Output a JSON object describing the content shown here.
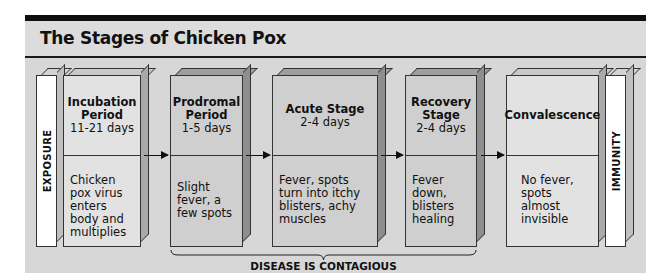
{
  "title": "The Stages of Chicken Pox",
  "start_marker": "EXPOSURE",
  "end_marker": "IMMUNITY",
  "stages": [
    {
      "name": "Incubation Period",
      "name_lines": [
        "Incubation",
        "Period"
      ],
      "duration": "11-21 days",
      "description": "Chicken pox virus enters body and multiplies"
    },
    {
      "name": "Prodromal Period",
      "name_lines": [
        "Prodromal",
        "Period"
      ],
      "duration": "1-5 days",
      "description": "Slight fever, a few spots"
    },
    {
      "name": "Acute Stage",
      "name_lines": [
        "Acute Stage"
      ],
      "duration": "2-4 days",
      "description": "Fever, spots turn into itchy blisters, achy muscles"
    },
    {
      "name": "Recovery Stage",
      "name_lines": [
        "Recovery",
        "Stage"
      ],
      "duration": "2-4 days",
      "description": "Fever down, blisters healing"
    },
    {
      "name": "Convalescence",
      "name_lines": [
        "Convalescence"
      ],
      "duration": "",
      "description": "No fever, spots almost invisible"
    }
  ],
  "contagious_label": "DISEASE IS CONTAGIOUS",
  "colors": {
    "panel": "#d7d7d7",
    "top_bar": "#0e0e0e",
    "light_box": "#e2e2e2",
    "dark_box": "#cfcfcf",
    "marker_box": "#ffffff"
  }
}
